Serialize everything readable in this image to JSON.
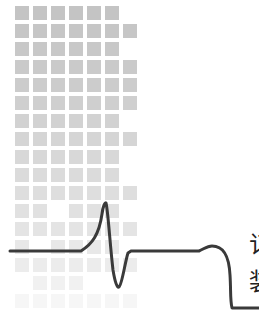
{
  "graphic": {
    "description": "Grid of gray squares fading downward with an ECG/pulse waveform line",
    "grid": {
      "origin_x": 15,
      "origin_y": 6,
      "cell_size": 14,
      "pitch": 18,
      "rows": [
        {
          "cols": [
            1,
            1,
            1,
            1,
            1,
            1,
            0
          ],
          "shade": "#c4c4c4"
        },
        {
          "cols": [
            1,
            1,
            1,
            1,
            1,
            1,
            1
          ],
          "shade": "#c6c6c6"
        },
        {
          "cols": [
            1,
            1,
            1,
            1,
            1,
            1,
            0
          ],
          "shade": "#c8c8c8"
        },
        {
          "cols": [
            1,
            1,
            1,
            1,
            1,
            1,
            1
          ],
          "shade": "#cacaca"
        },
        {
          "cols": [
            1,
            1,
            1,
            1,
            1,
            1,
            1
          ],
          "shade": "#cccccc"
        },
        {
          "cols": [
            1,
            1,
            1,
            1,
            1,
            1,
            1
          ],
          "shade": "#cfcfcf"
        },
        {
          "cols": [
            1,
            1,
            1,
            1,
            1,
            1,
            0
          ],
          "shade": "#d2d2d2"
        },
        {
          "cols": [
            1,
            1,
            1,
            1,
            1,
            1,
            1
          ],
          "shade": "#d5d5d5"
        },
        {
          "cols": [
            1,
            1,
            1,
            1,
            1,
            1,
            0
          ],
          "shade": "#d8d8d8"
        },
        {
          "cols": [
            1,
            1,
            1,
            1,
            1,
            1,
            0
          ],
          "shade": "#dbdbdb"
        },
        {
          "cols": [
            1,
            1,
            1,
            1,
            1,
            1,
            1
          ],
          "shade": "#dedede"
        },
        {
          "cols": [
            1,
            1,
            0,
            1,
            1,
            1,
            0
          ],
          "shade": "#e1e1e1"
        },
        {
          "cols": [
            1,
            1,
            1,
            1,
            1,
            1,
            1
          ],
          "shade": "#e4e4e4"
        },
        {
          "cols": [
            1,
            0,
            1,
            1,
            1,
            1,
            0
          ],
          "shade": "#e8e8e8"
        },
        {
          "cols": [
            1,
            1,
            1,
            1,
            1,
            1,
            1
          ],
          "shade": "#ececec"
        },
        {
          "cols": [
            0,
            1,
            1,
            1,
            0,
            0,
            0
          ],
          "shade": "#f1f1f1"
        },
        {
          "cols": [
            1,
            1,
            1,
            1,
            1,
            1,
            1
          ],
          "shade": "#f6f6f6"
        }
      ]
    },
    "waveform": {
      "color": "#3a3a3a",
      "stroke_width": 3,
      "path": "M10 251 L81 251 C92 244 99 235 102 214 C103 206 105 202 106 203 C108 210 110 245 113 270 C115 282 117 288 119 287 C122 285 125 262 128 253 L131 251 L199 251 C204 249 207 246 212 246 C224 246 229 256 230 275 C231 290 230 300 232 308 L259 308"
    },
    "edge_text": {
      "line1": "订",
      "line2": "装",
      "color": "#222222"
    }
  }
}
